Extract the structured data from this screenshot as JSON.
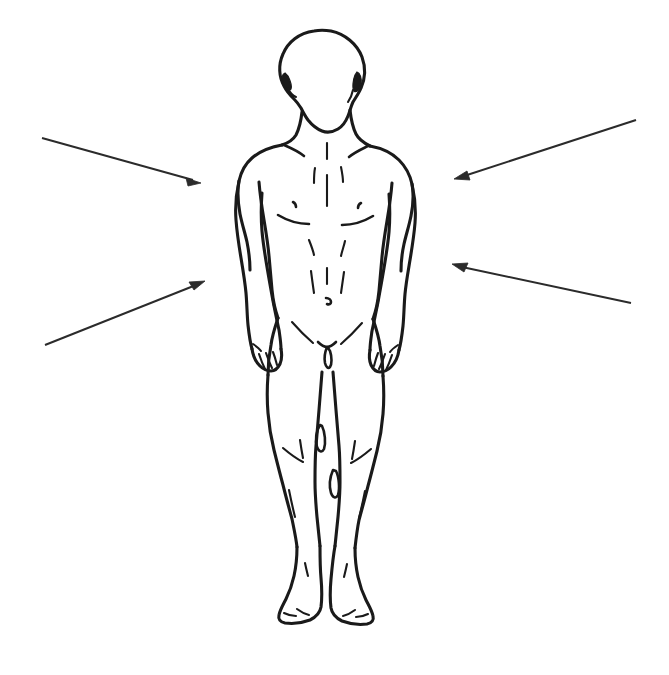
{
  "figure": {
    "view": "anterior",
    "line_color": "#1a1a1a",
    "background_color": "#ffffff",
    "arrow_color": "#2b2b2b",
    "labels_present": "none"
  },
  "arrows": [
    {
      "id": "arrow-upper-left",
      "name": "upper-left-pointer",
      "direction": "points right and down toward figure's right shoulder / upper arm",
      "label": "",
      "tail_x": 42,
      "tail_y": 138,
      "tip_x": 201,
      "tip_y": 183
    },
    {
      "id": "arrow-lower-left",
      "name": "lower-left-pointer",
      "direction": "points right and up toward figure's right forearm / hip",
      "label": "",
      "tail_x": 45,
      "tail_y": 345,
      "tip_x": 205,
      "tip_y": 281
    },
    {
      "id": "arrow-upper-right",
      "name": "upper-right-pointer",
      "direction": "points left and down toward figure's left shoulder / upper arm",
      "label": "",
      "tail_x": 636,
      "tail_y": 120,
      "tip_x": 454,
      "tip_y": 179
    },
    {
      "id": "arrow-lower-right",
      "name": "lower-right-pointer",
      "direction": "points left and up toward figure's left forearm / elbow",
      "label": "",
      "tail_x": 631,
      "tail_y": 303,
      "tip_x": 452,
      "tip_y": 264
    }
  ],
  "body_parts": [
    {
      "name": "head",
      "label": ""
    },
    {
      "name": "ears",
      "label": ""
    },
    {
      "name": "neck",
      "label": ""
    },
    {
      "name": "shoulders",
      "label": ""
    },
    {
      "name": "chest",
      "label": ""
    },
    {
      "name": "nipples",
      "label": ""
    },
    {
      "name": "abdomen",
      "label": ""
    },
    {
      "name": "navel",
      "label": ""
    },
    {
      "name": "arms",
      "label": ""
    },
    {
      "name": "hands",
      "label": ""
    },
    {
      "name": "groin",
      "label": ""
    },
    {
      "name": "thighs",
      "label": ""
    },
    {
      "name": "knees",
      "label": ""
    },
    {
      "name": "shins",
      "label": ""
    },
    {
      "name": "ankles",
      "label": ""
    },
    {
      "name": "feet",
      "label": ""
    }
  ]
}
